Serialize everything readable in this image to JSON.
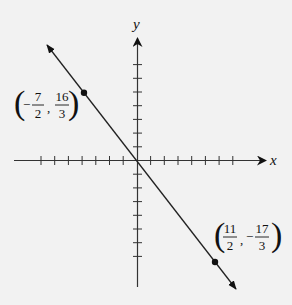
{
  "diagram": {
    "type": "coordinate-plane-line",
    "x_axis_label": "x",
    "y_axis_label": "y",
    "colors": {
      "background": "#f2f2f2",
      "ink": "#111111"
    },
    "points": [
      {
        "name": "point-a",
        "x_num": "7",
        "x_den": "2",
        "x_sign": "-",
        "y_num": "16",
        "y_den": "3",
        "y_sign": ""
      },
      {
        "name": "point-b",
        "x_num": "11",
        "x_den": "2",
        "x_sign": "",
        "y_num": "17",
        "y_den": "3",
        "y_sign": "-"
      }
    ],
    "ticks_per_half_axis": 7,
    "comma": ","
  }
}
